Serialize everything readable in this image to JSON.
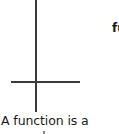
{
  "figure": {
    "axes": {
      "vertical_axis": true,
      "horizontal_axis": true,
      "color": "#3a3a3a"
    }
  },
  "side_text": {
    "fragment": "fu"
  },
  "caption": {
    "text": "A function is a"
  }
}
